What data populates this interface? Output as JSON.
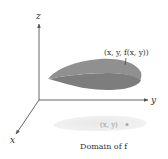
{
  "diagram": {
    "axes": {
      "z_label": "z",
      "y_label": "y",
      "x_label": "x"
    },
    "surface": {
      "point_label": "(x, y, f(x, y))",
      "color_top": "#8c8c8c",
      "color_bottom": "#7a7a7a"
    },
    "domain": {
      "point_label": "(x, y)",
      "caption": "Domain of f",
      "color": "#e6e6e6"
    },
    "axis_color": "#555555"
  }
}
